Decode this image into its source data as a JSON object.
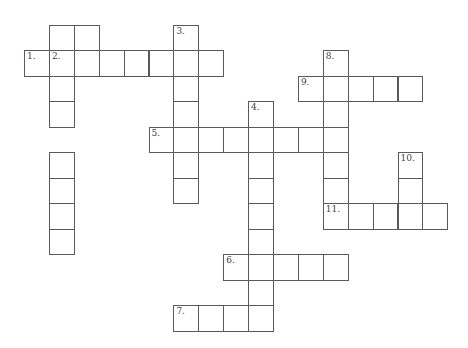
{
  "puzzle": {
    "type": "crossword",
    "cell_size": 25,
    "origin": {
      "x": 24,
      "y": 24.5
    },
    "cells": [
      [
        1,
        0
      ],
      [
        2,
        0
      ],
      [
        6,
        0
      ],
      [
        0,
        1
      ],
      [
        1,
        1
      ],
      [
        2,
        1
      ],
      [
        3,
        1
      ],
      [
        4,
        1
      ],
      [
        5,
        1
      ],
      [
        6,
        1
      ],
      [
        7,
        1
      ],
      [
        1,
        2
      ],
      [
        6,
        2
      ],
      [
        12,
        1
      ],
      [
        11,
        2
      ],
      [
        12,
        2
      ],
      [
        13,
        2
      ],
      [
        14,
        2
      ],
      [
        15,
        2
      ],
      [
        1,
        3
      ],
      [
        6,
        3
      ],
      [
        9,
        3
      ],
      [
        12,
        3
      ],
      [
        5,
        4
      ],
      [
        6,
        4
      ],
      [
        7,
        4
      ],
      [
        8,
        4
      ],
      [
        9,
        4
      ],
      [
        10,
        4
      ],
      [
        11,
        4
      ],
      [
        12,
        4
      ],
      [
        1,
        5
      ],
      [
        6,
        5
      ],
      [
        9,
        5
      ],
      [
        12,
        5
      ],
      [
        15,
        5
      ],
      [
        1,
        6
      ],
      [
        6,
        6
      ],
      [
        9,
        6
      ],
      [
        12,
        6
      ],
      [
        15,
        6
      ],
      [
        1,
        7
      ],
      [
        9,
        7
      ],
      [
        12,
        7
      ],
      [
        13,
        7
      ],
      [
        14,
        7
      ],
      [
        15,
        7
      ],
      [
        16,
        7
      ],
      [
        1,
        8
      ],
      [
        9,
        8
      ],
      [
        8,
        9
      ],
      [
        9,
        9
      ],
      [
        10,
        9
      ],
      [
        11,
        9
      ],
      [
        12,
        9
      ],
      [
        9,
        10
      ],
      [
        6,
        11
      ],
      [
        7,
        11
      ],
      [
        8,
        11
      ],
      [
        9,
        11
      ]
    ],
    "numbers": [
      {
        "label": "1.",
        "col": 0,
        "row": 1
      },
      {
        "label": "2.",
        "col": 1,
        "row": 1
      },
      {
        "label": "3.",
        "col": 6,
        "row": 0
      },
      {
        "label": "4.",
        "col": 9,
        "row": 3
      },
      {
        "label": "5.",
        "col": 5,
        "row": 4
      },
      {
        "label": "6.",
        "col": 8,
        "row": 9
      },
      {
        "label": "7.",
        "col": 6,
        "row": 11
      },
      {
        "label": "8.",
        "col": 12,
        "row": 1
      },
      {
        "label": "9.",
        "col": 11,
        "row": 2
      },
      {
        "label": "10.",
        "col": 15,
        "row": 5
      },
      {
        "label": "11.",
        "col": 12,
        "row": 7
      }
    ],
    "entries": {
      "across": [
        {
          "number": "1",
          "length": 8
        },
        {
          "number": "5",
          "length": 8
        },
        {
          "number": "6",
          "length": 5
        },
        {
          "number": "7",
          "length": 4
        },
        {
          "number": "9",
          "length": 5
        },
        {
          "number": "11",
          "length": 5
        }
      ],
      "down": [
        {
          "number": "2",
          "length": 8
        },
        {
          "number": "3",
          "length": 7
        },
        {
          "number": "4",
          "length": 9
        },
        {
          "number": "8",
          "length": 7
        },
        {
          "number": "10",
          "length": 3
        }
      ]
    },
    "colors": {
      "line": "#5a5a5a",
      "background": "#ffffff",
      "number": "#444444"
    }
  }
}
